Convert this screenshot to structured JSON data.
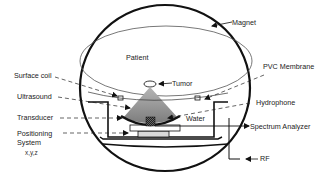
{
  "diagram": {
    "title": "",
    "labels": {
      "magnet": "Magnet",
      "patient": "Patient",
      "tumor": "Tumor",
      "surface_coil": "Surface coil",
      "pvc_membrane": "PVC Membrane",
      "ultrasound": "Ultrasound",
      "hydrophone": "Hydrophone",
      "transducer": "Transducer",
      "water": "Water",
      "positioning_system": "Positioning",
      "positioning_system_line2": "System",
      "positioning_axes": "x,y,z",
      "spectrum_analyzer": "Spectrum Analyzer",
      "rf": "RF"
    },
    "colors": {
      "line": "#111111",
      "ultrasound_beam": "#8a8a8a",
      "transducer": "#333333",
      "background": "#ffffff"
    }
  }
}
